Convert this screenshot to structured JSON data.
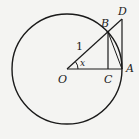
{
  "diagram": {
    "type": "unit-circle-trig-geometry",
    "labels": {
      "O": "O",
      "A": "A",
      "B": "B",
      "C": "C",
      "D": "D",
      "radius": "1",
      "angle": "x"
    },
    "colors": {
      "stroke": "#1a1a1a",
      "background": "#f4f4f2"
    }
  }
}
